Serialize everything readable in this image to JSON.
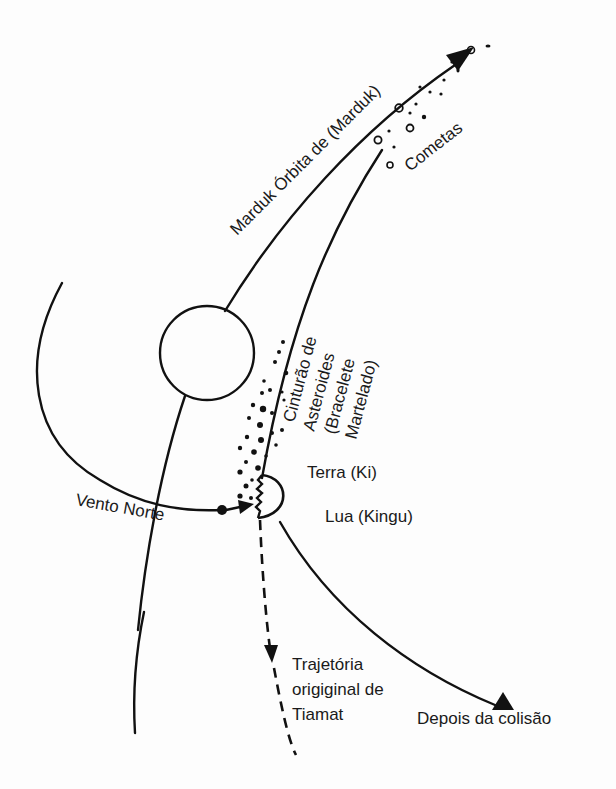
{
  "diagram": {
    "type": "orbital-collision-sketch",
    "colors": {
      "ink": "#111111",
      "background": "#fdfdfd"
    },
    "labels": {
      "marduk_orbit": "Marduk Órbita de (Marduk)",
      "comets": "Cometas",
      "asteroid_belt_line1": "Cinturão de",
      "asteroid_belt_line2": "Asteroides",
      "asteroid_belt_line3": "(Bracelete",
      "asteroid_belt_line4": "Martelado)",
      "earth": "Terra (Ki)",
      "moon": "Lua (Kingu)",
      "north_wind": "Vento Norte",
      "tiamat_line1": "Trajetória",
      "tiamat_line2": "origiginal de",
      "tiamat_line3": "Tiamat",
      "after_collision": "Depois da colisão"
    },
    "elements": [
      {
        "id": "marduk-orbit",
        "style": "solid",
        "arrow": "end"
      },
      {
        "id": "outer-planet-circle"
      },
      {
        "id": "left-arc",
        "style": "solid"
      },
      {
        "id": "north-wind-arrow",
        "arrow": "end"
      },
      {
        "id": "tiamat-earth-half-circle"
      },
      {
        "id": "tiamat-original-trajectory",
        "style": "dashed",
        "arrow": "mid"
      },
      {
        "id": "after-collision-path",
        "style": "solid",
        "arrow": "end"
      },
      {
        "id": "comet-trail",
        "style": "dots"
      },
      {
        "id": "asteroid-belt",
        "style": "dots"
      }
    ]
  }
}
